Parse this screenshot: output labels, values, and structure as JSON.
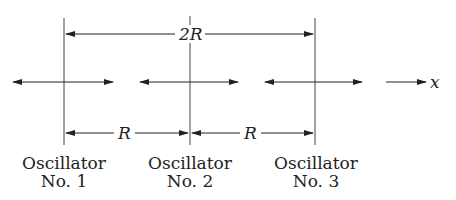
{
  "diagram": {
    "axis_label": "x",
    "spacing_labels": {
      "total": "2R",
      "first": "R",
      "second": "R"
    },
    "oscillators": [
      {
        "name": "Oscillator",
        "number": "No. 1"
      },
      {
        "name": "Oscillator",
        "number": "No. 2"
      },
      {
        "name": "Oscillator",
        "number": "No. 3"
      }
    ]
  }
}
